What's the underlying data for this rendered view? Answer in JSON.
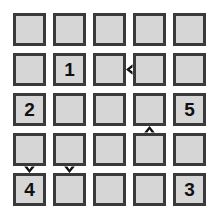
{
  "board": {
    "title": "Number Grid Puzzle",
    "rows": 5,
    "columns": 5,
    "cell_background": "#d6d6d6",
    "cell_border_color": "#3a3a3a",
    "page_background": "#ffffff",
    "label_color": "#111111",
    "cells": [
      {
        "row": 1,
        "col": 1,
        "label": ""
      },
      {
        "row": 1,
        "col": 2,
        "label": ""
      },
      {
        "row": 1,
        "col": 3,
        "label": ""
      },
      {
        "row": 1,
        "col": 4,
        "label": ""
      },
      {
        "row": 1,
        "col": 5,
        "label": ""
      },
      {
        "row": 2,
        "col": 1,
        "label": ""
      },
      {
        "row": 2,
        "col": 2,
        "label": "1"
      },
      {
        "row": 2,
        "col": 3,
        "label": ""
      },
      {
        "row": 2,
        "col": 4,
        "label": ""
      },
      {
        "row": 2,
        "col": 5,
        "label": ""
      },
      {
        "row": 3,
        "col": 1,
        "label": "2"
      },
      {
        "row": 3,
        "col": 2,
        "label": ""
      },
      {
        "row": 3,
        "col": 3,
        "label": ""
      },
      {
        "row": 3,
        "col": 4,
        "label": ""
      },
      {
        "row": 3,
        "col": 5,
        "label": "5"
      },
      {
        "row": 4,
        "col": 1,
        "label": ""
      },
      {
        "row": 4,
        "col": 2,
        "label": ""
      },
      {
        "row": 4,
        "col": 3,
        "label": ""
      },
      {
        "row": 4,
        "col": 4,
        "label": ""
      },
      {
        "row": 4,
        "col": 5,
        "label": ""
      },
      {
        "row": 5,
        "col": 1,
        "label": "4"
      },
      {
        "row": 5,
        "col": 2,
        "label": ""
      },
      {
        "row": 5,
        "col": 3,
        "label": ""
      },
      {
        "row": 5,
        "col": 4,
        "label": ""
      },
      {
        "row": 5,
        "col": 5,
        "label": "3"
      }
    ],
    "markers": [
      {
        "icon": "caret-left-icon",
        "glyph": "◀",
        "direction": "left",
        "between_rows": [
          2,
          2
        ],
        "between_cols": [
          3,
          4
        ]
      },
      {
        "icon": "caret-up-icon",
        "glyph": "▲",
        "direction": "up",
        "between_rows": [
          3,
          4
        ],
        "between_cols": [
          4,
          4
        ]
      },
      {
        "icon": "caret-down-icon",
        "glyph": "▼",
        "direction": "down",
        "between_rows": [
          4,
          5
        ],
        "between_cols": [
          1,
          1
        ]
      },
      {
        "icon": "caret-down-icon",
        "glyph": "▼",
        "direction": "down",
        "between_rows": [
          4,
          5
        ],
        "between_cols": [
          2,
          2
        ]
      }
    ]
  }
}
